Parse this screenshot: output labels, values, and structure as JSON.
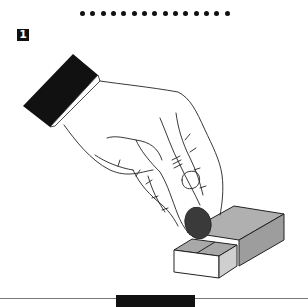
{
  "figure": {
    "divider_dot_count": 15,
    "step": {
      "number": "1"
    },
    "illustration": {
      "subject": "hand placing coin onto open matchbox drawer",
      "elements": [
        "sleeved-hand",
        "coin",
        "matchbox-sleeve",
        "matchbox-drawer"
      ],
      "colors": {
        "sleeve": "#111111",
        "coin": "#3a3a3a",
        "box_gray": "#a9a9a9",
        "box_white": "#ffffff",
        "outline": "#222222"
      }
    },
    "caption_label": {
      "text": ""
    }
  }
}
